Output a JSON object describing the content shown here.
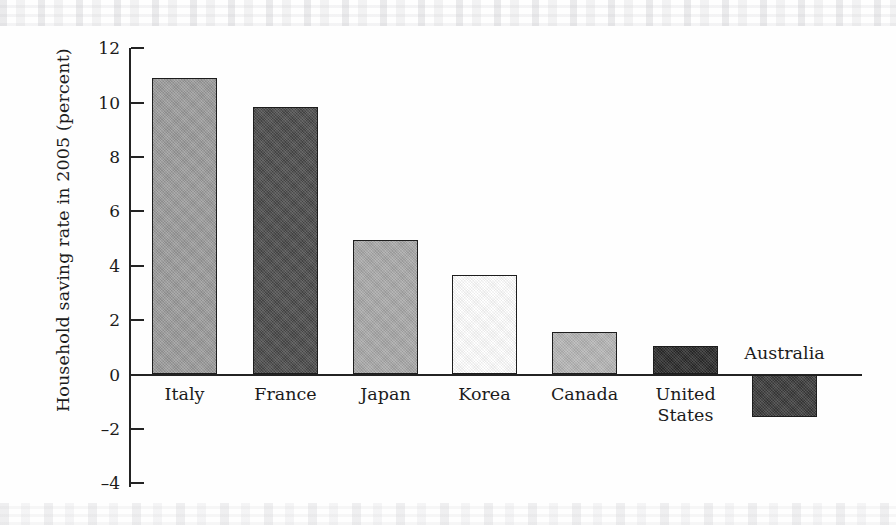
{
  "chart_data": {
    "type": "bar",
    "title": "",
    "xlabel": "",
    "ylabel": "Household saving rate in 2005 (percent)",
    "categories": [
      "Italy",
      "France",
      "Japan",
      "Korea",
      "Canada",
      "United\nStates",
      "Australia"
    ],
    "values": [
      10.9,
      9.85,
      4.95,
      3.65,
      1.55,
      1.05,
      -1.55
    ],
    "ylim": [
      -4,
      12
    ],
    "ytick_labels": [
      "12",
      "10",
      "8",
      "6",
      "4",
      "2",
      "0",
      "–2",
      "–4"
    ],
    "ytick_values": [
      12,
      10,
      8,
      6,
      4,
      2,
      0,
      -2,
      -4
    ],
    "grid": false,
    "legend": "none",
    "bar_colors": [
      "#9a9a9a",
      "#4a4a4a",
      "#a8a8a8",
      "#ffffff",
      "#b5b5b5",
      "#2a2a2a",
      "#3a3a3a"
    ],
    "bar_edge_color": "#1d1d1d",
    "axis_color": "#232323",
    "background_color": "#fefefe"
  }
}
